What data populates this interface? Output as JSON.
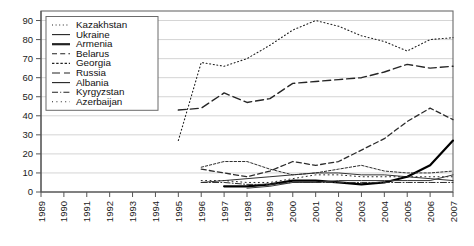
{
  "chart_data": {
    "type": "line",
    "title": "",
    "subtitle": "",
    "xlabel": "",
    "ylabel": "",
    "xlim": [
      1989,
      2007
    ],
    "ylim": [
      0,
      95
    ],
    "yticks": [
      0,
      10,
      20,
      30,
      40,
      50,
      60,
      70,
      80,
      90
    ],
    "grid": true,
    "grid_axis": "y",
    "legend_position": "top-left",
    "x": [
      1989,
      1990,
      1991,
      1992,
      1993,
      1994,
      1995,
      1996,
      1997,
      1998,
      1999,
      2000,
      2001,
      2002,
      2003,
      2004,
      2005,
      2006,
      2007
    ],
    "categories": [
      "1989",
      "1990",
      "1991",
      "1992",
      "1993",
      "1994",
      "1995",
      "1996",
      "1997",
      "1998",
      "1999",
      "2000",
      "2001",
      "2002",
      "2003",
      "2004",
      "2005",
      "2006",
      "2007"
    ],
    "series": [
      {
        "name": "Kazakhstan",
        "style": "dotted",
        "width": 1.1,
        "color": "#222222",
        "x": [
          1995,
          1996,
          1997,
          1998,
          1999,
          2000,
          2001,
          2002,
          2003,
          2004,
          2005,
          2006,
          2007
        ],
        "values": [
          27,
          68,
          66,
          70,
          77,
          85,
          90,
          87,
          82,
          79,
          74,
          80,
          81
        ]
      },
      {
        "name": "Ukraine",
        "style": "solid",
        "width": 1.0,
        "color": "#333333",
        "x": [
          1996,
          1997,
          1998,
          1999,
          2000,
          2001,
          2002,
          2003,
          2004,
          2005,
          2006,
          2007
        ],
        "values": [
          5,
          6,
          7,
          8,
          9,
          10,
          10,
          9,
          9,
          8,
          7,
          6
        ]
      },
      {
        "name": "Armenia",
        "style": "solid",
        "width": 2.2,
        "color": "#000000",
        "x": [
          1997,
          1998,
          1999,
          2000,
          2001,
          2002,
          2003,
          2004,
          2005,
          2006,
          2007
        ],
        "values": [
          3,
          3,
          4,
          6,
          6,
          5,
          4,
          5,
          8,
          14,
          27
        ]
      },
      {
        "name": "Belarus",
        "style": "dashed",
        "width": 1.3,
        "color": "#2b2b2b",
        "x": [
          1996,
          1997,
          1998,
          1999,
          2000,
          2001,
          2002,
          2003,
          2004,
          2005,
          2006,
          2007
        ],
        "values": [
          12,
          10,
          8,
          11,
          16,
          14,
          16,
          22,
          28,
          37,
          44,
          38
        ]
      },
      {
        "name": "Georgia",
        "style": "fine-dashed",
        "width": 1.0,
        "color": "#2e2e2e",
        "x": [
          1996,
          1997,
          1998,
          1999,
          2000,
          2001,
          2002,
          2003,
          2004,
          2005,
          2006,
          2007
        ],
        "values": [
          13,
          16,
          16,
          12,
          9,
          10,
          12,
          14,
          11,
          10,
          10,
          11
        ]
      },
      {
        "name": "Russia",
        "style": "long-dashed",
        "width": 1.4,
        "color": "#262626",
        "x": [
          1995,
          1996,
          1997,
          1998,
          1999,
          2000,
          2001,
          2002,
          2003,
          2004,
          2005,
          2006,
          2007
        ],
        "values": [
          43,
          44,
          52,
          47,
          49,
          57,
          58,
          59,
          60,
          63,
          67,
          65,
          66
        ]
      },
      {
        "name": "Albania",
        "style": "solid",
        "width": 1.0,
        "color": "#3a3a3a",
        "x": [
          1998,
          1999,
          2000,
          2001,
          2002,
          2003,
          2004,
          2005,
          2006,
          2007
        ],
        "values": [
          2,
          3,
          5,
          5,
          6,
          6,
          6,
          6,
          6,
          9
        ]
      },
      {
        "name": "Kyrgyzstan",
        "style": "dash-dot",
        "width": 1.0,
        "color": "#303030",
        "x": [
          1996,
          1997,
          1998,
          1999,
          2000,
          2001,
          2002,
          2003,
          2004,
          2005,
          2006,
          2007
        ],
        "values": [
          5,
          5,
          4,
          4,
          5,
          5,
          5,
          5,
          5,
          5,
          5,
          5
        ]
      },
      {
        "name": "Azerbaijan",
        "style": "sparse-dotted",
        "width": 1.0,
        "color": "#2a2a2a",
        "x": [
          1996,
          1997,
          1998,
          1999,
          2000,
          2001,
          2002,
          2003,
          2004,
          2005,
          2006,
          2007
        ],
        "values": [
          6,
          6,
          5,
          5,
          7,
          9,
          9,
          8,
          8,
          8,
          8,
          8
        ]
      }
    ]
  },
  "legend": {
    "items": [
      {
        "label": "Kazakhstan",
        "style": "dotted"
      },
      {
        "label": "Ukraine",
        "style": "solid"
      },
      {
        "label": "Armenia",
        "style": "solid-thick"
      },
      {
        "label": "Belarus",
        "style": "dashed"
      },
      {
        "label": "Georgia",
        "style": "fine-dashed"
      },
      {
        "label": "Russia",
        "style": "long-dashed"
      },
      {
        "label": "Albania",
        "style": "solid"
      },
      {
        "label": "Kyrgyzstan",
        "style": "dash-dot"
      },
      {
        "label": "Azerbaijan",
        "style": "sparse-dotted"
      }
    ]
  },
  "axes": {
    "y_tick_labels": [
      "90",
      "80",
      "70",
      "60",
      "50",
      "40",
      "30",
      "20",
      "10",
      "0"
    ],
    "x_tick_labels": [
      "1989",
      "1990",
      "1991",
      "1992",
      "1993",
      "1994",
      "1995",
      "1996",
      "1997",
      "1998",
      "1999",
      "2000",
      "2001",
      "2002",
      "2003",
      "2004",
      "2005",
      "2006",
      "2007"
    ]
  },
  "colors": {
    "background": "#ffffff",
    "grid": "#c9c9c9",
    "axis": "#555555",
    "frame": "#6b6b6b",
    "text": "#1a1a1a"
  }
}
